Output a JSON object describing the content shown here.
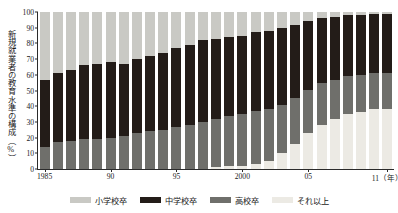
{
  "chart_data": {
    "type": "bar",
    "title": "",
    "xlabel": "年",
    "ylabel": "新規就業者の教育水準の構成（%）",
    "ylim": [
      0,
      100
    ],
    "yticks": [
      0,
      10,
      20,
      30,
      40,
      50,
      60,
      70,
      80,
      90,
      100
    ],
    "grid": false,
    "stacked": true,
    "stack_order_top_to_bottom": [
      "小学校卒",
      "中学校卒",
      "高校卒",
      "それ以上"
    ],
    "legend_position": "bottom",
    "x_tick_labels": [
      "1985",
      "90",
      "95",
      "2000",
      "05",
      "11（年）"
    ],
    "x_tick_years": [
      1985,
      1990,
      1995,
      2000,
      2005,
      2011
    ],
    "categories": [
      "1985",
      "1986",
      "1987",
      "1988",
      "1989",
      "1990",
      "1991",
      "1992",
      "1993",
      "1994",
      "1995",
      "1996",
      "1997",
      "1998",
      "1999",
      "2000",
      "2001",
      "2002",
      "2003",
      "2004",
      "2005",
      "2006",
      "2007",
      "2008",
      "2009",
      "2010",
      "2011"
    ],
    "series": [
      {
        "name": "小学校卒",
        "color": "#c9c9c4",
        "values": [
          43,
          39,
          37,
          34,
          33,
          32,
          33,
          30,
          28,
          26,
          23,
          21,
          18,
          17,
          16,
          15,
          13,
          12,
          10,
          8,
          6,
          4,
          3,
          2,
          2,
          1,
          1
        ]
      },
      {
        "name": "中学校卒",
        "color": "#231c18",
        "values": [
          43,
          44,
          45,
          47,
          48,
          48,
          46,
          47,
          48,
          49,
          50,
          51,
          52,
          51,
          50,
          50,
          50,
          50,
          49,
          47,
          44,
          41,
          40,
          39,
          38,
          38,
          38
        ]
      },
      {
        "name": "高校卒",
        "color": "#6f6f6b",
        "values": [
          14,
          17,
          18,
          19,
          19,
          20,
          21,
          23,
          24,
          25,
          27,
          28,
          30,
          31,
          32,
          33,
          34,
          33,
          31,
          29,
          27,
          27,
          25,
          24,
          24,
          23,
          23
        ]
      },
      {
        "name": "それ以上",
        "color": "#eceae4",
        "values": [
          0,
          0,
          0,
          0,
          0,
          0,
          0,
          0,
          0,
          0,
          0,
          0,
          0,
          1,
          2,
          2,
          3,
          5,
          10,
          16,
          23,
          28,
          32,
          35,
          36,
          38,
          38
        ]
      }
    ]
  },
  "legend": {
    "items": [
      {
        "label": "小学校卒",
        "color": "#c9c9c4"
      },
      {
        "label": "中学校卒",
        "color": "#231c18"
      },
      {
        "label": "高校卒",
        "color": "#6f6f6b"
      },
      {
        "label": "それ以上",
        "color": "#eceae4"
      }
    ]
  }
}
